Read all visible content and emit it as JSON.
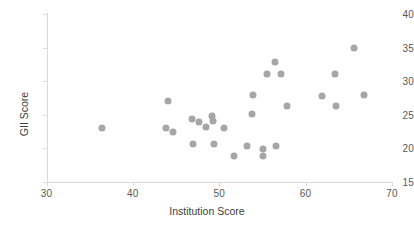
{
  "chart_data": {
    "type": "scatter",
    "title": "",
    "xlabel": "Institution Score",
    "ylabel": "GII Score",
    "xlim": [
      30,
      70
    ],
    "ylim": [
      15,
      40
    ],
    "xticks": [
      30,
      40,
      50,
      60,
      70
    ],
    "yticks": [
      15,
      20,
      25,
      30,
      35,
      40
    ],
    "grid": false,
    "legend": null,
    "marker_color": "#a6a6a6",
    "axis_color": "#d9d9d9",
    "label_color": "#595959",
    "points": [
      {
        "x": 36.4,
        "y": 23.0
      },
      {
        "x": 44.1,
        "y": 27.1
      },
      {
        "x": 43.8,
        "y": 23.1
      },
      {
        "x": 44.6,
        "y": 22.5
      },
      {
        "x": 46.8,
        "y": 24.4
      },
      {
        "x": 47.0,
        "y": 20.6
      },
      {
        "x": 47.6,
        "y": 23.9
      },
      {
        "x": 48.5,
        "y": 23.2
      },
      {
        "x": 49.2,
        "y": 24.8
      },
      {
        "x": 49.3,
        "y": 24.1
      },
      {
        "x": 49.4,
        "y": 20.6
      },
      {
        "x": 50.5,
        "y": 23.0
      },
      {
        "x": 51.7,
        "y": 18.8
      },
      {
        "x": 53.2,
        "y": 20.4
      },
      {
        "x": 53.8,
        "y": 25.1
      },
      {
        "x": 53.9,
        "y": 28.0
      },
      {
        "x": 55.1,
        "y": 19.9
      },
      {
        "x": 55.1,
        "y": 18.8
      },
      {
        "x": 55.5,
        "y": 31.0
      },
      {
        "x": 56.4,
        "y": 32.8
      },
      {
        "x": 56.6,
        "y": 20.4
      },
      {
        "x": 57.1,
        "y": 31.0
      },
      {
        "x": 57.9,
        "y": 26.3
      },
      {
        "x": 61.9,
        "y": 27.8
      },
      {
        "x": 63.4,
        "y": 31.1
      },
      {
        "x": 63.5,
        "y": 26.3
      },
      {
        "x": 65.6,
        "y": 34.9
      },
      {
        "x": 66.8,
        "y": 28.0
      }
    ]
  }
}
